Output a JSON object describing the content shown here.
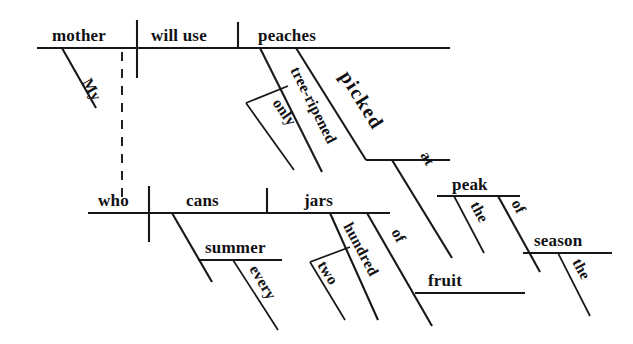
{
  "diagram": {
    "type": "reed-kellogg-sentence-diagram",
    "sentence": "My mother, who cans two hundred jars of fruit every summer, will use only tree-ripened peaches picked at the peak of the season.",
    "ink_color": "#17171a",
    "background_color": "#ffffff",
    "main_clause": {
      "subject": "mother",
      "verb": "will use",
      "direct_object": "peaches",
      "subject_modifier": "My",
      "object_modifiers": [
        "tree-ripened",
        "picked"
      ],
      "adverb_of_modifier": "only"
    },
    "relative_clause": {
      "subject": "who",
      "verb": "cans",
      "direct_object": "jars",
      "object_modifiers": [
        "hundred",
        "of"
      ],
      "hundred_modifier": "two",
      "of_object": "fruit",
      "verb_modifier_phrase": "summer",
      "summer_modifier": "every"
    },
    "participial_phrase": {
      "participle": "picked",
      "preposition": "at",
      "prep_object": "peak",
      "peak_article": "the",
      "peak_modifier_prep": "of",
      "of_object": "season",
      "season_article": "the"
    },
    "words": {
      "mother": "mother",
      "will_use": "will use",
      "peaches": "peaches",
      "my": "My",
      "tree_ripened": "tree-ripened",
      "only": "only",
      "picked": "picked",
      "at": "at",
      "peak": "peak",
      "the_peak": "the",
      "of_season": "of",
      "season": "season",
      "the_season": "the",
      "who": "who",
      "cans": "cans",
      "jars": "jars",
      "summer": "summer",
      "every": "every",
      "hundred": "hundred",
      "two": "two",
      "of_fruit": "of",
      "fruit": "fruit"
    }
  }
}
